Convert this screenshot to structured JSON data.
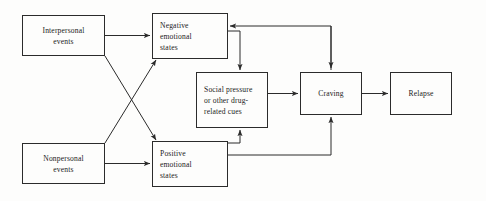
{
  "diagram": {
    "type": "flowchart",
    "title": "",
    "background_color": "#fdfdfc",
    "line_color": "#2b2b2b",
    "nodes": [
      {
        "id": "interpersonal-events",
        "label": "Interpersonal\nevents",
        "x": 22,
        "y": 15,
        "w": 83,
        "h": 41,
        "align": "center"
      },
      {
        "id": "nonpersonal-events",
        "label": "Nonpersonal\nevents",
        "x": 22,
        "y": 143,
        "w": 83,
        "h": 41,
        "align": "center"
      },
      {
        "id": "negative-emotional-states",
        "label": "Negative\nemotional\nstates",
        "x": 152,
        "y": 13,
        "w": 76,
        "h": 46,
        "align": "left"
      },
      {
        "id": "positive-emotional-states",
        "label": "Positive\nemotional\nstates",
        "x": 152,
        "y": 141,
        "w": 76,
        "h": 46,
        "align": "left"
      },
      {
        "id": "social-pressure-cues",
        "label": "Social pressure\nor other drug-\nrelated cues",
        "x": 196,
        "y": 72,
        "w": 72,
        "h": 56,
        "align": "left"
      },
      {
        "id": "craving",
        "label": "Craving",
        "x": 300,
        "y": 72,
        "w": 62,
        "h": 43,
        "align": "center"
      },
      {
        "id": "relapse",
        "label": "Relapse",
        "x": 390,
        "y": 72,
        "w": 62,
        "h": 43,
        "align": "center"
      }
    ],
    "edges": [
      {
        "from": "interpersonal-events",
        "to": "negative-emotional-states",
        "style": "straight-horizontal"
      },
      {
        "from": "interpersonal-events",
        "to": "positive-emotional-states",
        "style": "diagonal-crossing"
      },
      {
        "from": "nonpersonal-events",
        "to": "positive-emotional-states",
        "style": "straight-horizontal"
      },
      {
        "from": "nonpersonal-events",
        "to": "negative-emotional-states",
        "style": "diagonal-crossing"
      },
      {
        "from": "negative-emotional-states",
        "to": "social-pressure-cues",
        "style": "orthogonal-down"
      },
      {
        "from": "positive-emotional-states",
        "to": "social-pressure-cues",
        "style": "orthogonal-up"
      },
      {
        "from": "social-pressure-cues",
        "to": "craving",
        "style": "straight-horizontal"
      },
      {
        "from": "craving",
        "to": "negative-emotional-states",
        "style": "orthogonal-feedback-top"
      },
      {
        "from": "craving",
        "to": "positive-emotional-states",
        "style": "orthogonal-feedback-bottom"
      },
      {
        "from": "craving",
        "to": "relapse",
        "style": "straight-horizontal"
      }
    ]
  }
}
